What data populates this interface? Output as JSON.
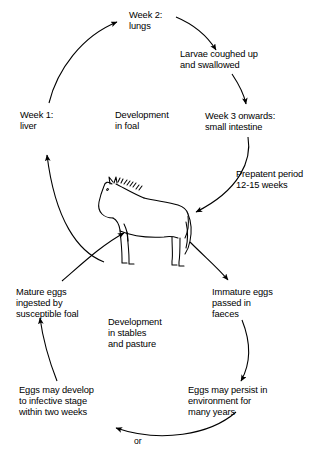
{
  "diagram": {
    "type": "cycle-flowchart",
    "background_color": "#ffffff",
    "line_color": "#000000",
    "center_illustration": "foal-line-drawing",
    "upper_cycle": {
      "center_label": "Development\nin foal",
      "center_label_lines": [
        "Development",
        "in foal"
      ],
      "nodes": [
        {
          "id": "week1",
          "text": "Week 1:\nliver",
          "lines": [
            "Week 1:",
            "liver"
          ]
        },
        {
          "id": "week2",
          "text": "Week 2:\nlungs",
          "lines": [
            "Week 2:",
            "lungs"
          ]
        },
        {
          "id": "larvae",
          "text": "Larvae coughed up\nand swallowed",
          "lines": [
            "Larvae coughed up",
            "and swallowed"
          ]
        },
        {
          "id": "week3",
          "text": "Week 3 onwards:\nsmall intestine",
          "lines": [
            "Week 3 onwards:",
            "small intestine"
          ]
        },
        {
          "id": "prepatent",
          "text": "Prepatent period\n12-15 weeks",
          "lines": [
            "Prepatent period",
            "12-15 weeks"
          ]
        }
      ]
    },
    "lower_cycle": {
      "center_label": "Development\nin stables\nand pasture",
      "center_label_lines": [
        "Development",
        "in stables",
        "and pasture"
      ],
      "connector_label": "or",
      "nodes": [
        {
          "id": "immature-eggs",
          "text": "Immature eggs\npassed in\nfaeces",
          "lines": [
            "Immature eggs",
            "passed in",
            "faeces"
          ]
        },
        {
          "id": "persist",
          "text": "Eggs may persist in\nenvironment for\nmany years",
          "lines": [
            "Eggs may persist in",
            "environment for",
            "many years"
          ]
        },
        {
          "id": "infective",
          "text": "Eggs may develop\nto infective stage\nwithin two weeks",
          "lines": [
            "Eggs may develop",
            "to infective stage",
            "within two weeks"
          ]
        },
        {
          "id": "mature-eggs",
          "text": "Mature eggs\ningested by\nsusceptible foal",
          "lines": [
            "Mature eggs",
            "ingested by",
            "susceptible foal"
          ]
        }
      ]
    }
  }
}
